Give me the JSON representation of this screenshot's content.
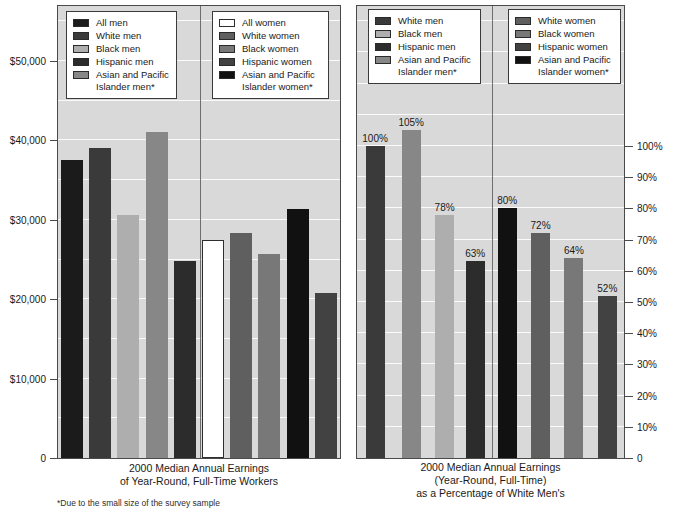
{
  "footnote": "*Due to the small size of the survey sample",
  "chart_data": [
    {
      "type": "bar",
      "title": "2000 Median Annual Earnings of Year-Round, Full-Time Workers",
      "caption_lines": [
        "2000 Median Annual Earnings",
        "of Year-Round, Full-Time Workers"
      ],
      "xlabel": "",
      "ylabel": "Median annual earnings (dollars)",
      "ylim": [
        0,
        50000
      ],
      "ytick_step": 10000,
      "grid_step": 5000,
      "grid": true,
      "axis_side": "left",
      "ytick_labels_desc": [
        "$50,000",
        "$40,000",
        "$30,000",
        "$20,000",
        "$10,000",
        "0"
      ],
      "legend_position": "top-inside",
      "groups": [
        {
          "name": "Men",
          "bars": [
            {
              "label": "All men",
              "value": 37500,
              "color": "#1b1b1b"
            },
            {
              "label": "White men",
              "value": 39000,
              "color": "#3a3a3a"
            },
            {
              "label": "Black men",
              "value": 30600,
              "color": "#aeaeae"
            },
            {
              "label": "Asian and Pacific Islander men*",
              "value": 41000,
              "color": "#878787"
            },
            {
              "label": "Hispanic men",
              "value": 24800,
              "color": "#2c2c2c"
            }
          ]
        },
        {
          "name": "Women",
          "bars": [
            {
              "label": "All women",
              "value": 27400,
              "color": "#ffffff",
              "outline": "#2e2e2e"
            },
            {
              "label": "White women",
              "value": 28400,
              "color": "#5f5f5f"
            },
            {
              "label": "Black women",
              "value": 25700,
              "color": "#787878"
            },
            {
              "label": "Asian and Pacific Islander women*",
              "value": 31400,
              "color": "#111111"
            },
            {
              "label": "Hispanic women",
              "value": 20800,
              "color": "#424242"
            }
          ]
        }
      ],
      "legends": [
        {
          "items": [
            {
              "label": "All men",
              "color": "#1b1b1b"
            },
            {
              "label": "White men",
              "color": "#3a3a3a"
            },
            {
              "label": "Black men",
              "color": "#aeaeae"
            },
            {
              "label": "Hispanic men",
              "color": "#2c2c2c"
            },
            {
              "label": "Asian and Pacific Islander men*",
              "color": "#878787"
            }
          ]
        },
        {
          "items": [
            {
              "label": "All women",
              "color": "#ffffff",
              "outline": "#2e2e2e"
            },
            {
              "label": "White women",
              "color": "#5f5f5f"
            },
            {
              "label": "Black women",
              "color": "#787878"
            },
            {
              "label": "Hispanic women",
              "color": "#424242"
            },
            {
              "label": "Asian and Pacific Islander women*",
              "color": "#111111"
            }
          ]
        }
      ]
    },
    {
      "type": "bar",
      "title": "2000 Median Annual Earnings (Year-Round, Full-Time) as a Percentage of White Men's",
      "caption_lines": [
        "2000 Median Annual Earnings",
        "(Year-Round, Full-Time)",
        "as a Percentage of White Men's"
      ],
      "xlabel": "",
      "ylabel": "Percentage of white men's earnings",
      "ylim": [
        0,
        100
      ],
      "ytick_step": 10,
      "grid_step": 10,
      "grid": true,
      "axis_side": "right",
      "ytick_labels_desc": [
        "100%",
        "90%",
        "80%",
        "70%",
        "60%",
        "50%",
        "40%",
        "30%",
        "20%",
        "10%",
        "0"
      ],
      "legend_position": "top-inside",
      "groups": [
        {
          "name": "Men",
          "bars": [
            {
              "label": "White men",
              "value": 100,
              "value_label": "100%",
              "color": "#3a3a3a"
            },
            {
              "label": "Asian and Pacific Islander men*",
              "value": 105,
              "value_label": "105%",
              "color": "#878787"
            },
            {
              "label": "Black men",
              "value": 78,
              "value_label": "78%",
              "color": "#aeaeae"
            },
            {
              "label": "Hispanic men",
              "value": 63,
              "value_label": "63%",
              "color": "#2c2c2c"
            }
          ]
        },
        {
          "name": "Women",
          "bars": [
            {
              "label": "Asian and Pacific Islander women*",
              "value": 80,
              "value_label": "80%",
              "color": "#111111"
            },
            {
              "label": "White women",
              "value": 72,
              "value_label": "72%",
              "color": "#5f5f5f"
            },
            {
              "label": "Black women",
              "value": 64,
              "value_label": "64%",
              "color": "#787878"
            },
            {
              "label": "Hispanic women",
              "value": 52,
              "value_label": "52%",
              "color": "#424242"
            }
          ]
        }
      ],
      "legends": [
        {
          "items": [
            {
              "label": "White men",
              "color": "#3a3a3a"
            },
            {
              "label": "Black men",
              "color": "#aeaeae"
            },
            {
              "label": "Hispanic men",
              "color": "#2c2c2c"
            },
            {
              "label": "Asian and Pacific Islander men*",
              "color": "#878787"
            }
          ]
        },
        {
          "items": [
            {
              "label": "White women",
              "color": "#5f5f5f"
            },
            {
              "label": "Black women",
              "color": "#787878"
            },
            {
              "label": "Hispanic women",
              "color": "#424242"
            },
            {
              "label": "Asian and Pacific Islander women*",
              "color": "#111111"
            }
          ]
        }
      ]
    }
  ]
}
